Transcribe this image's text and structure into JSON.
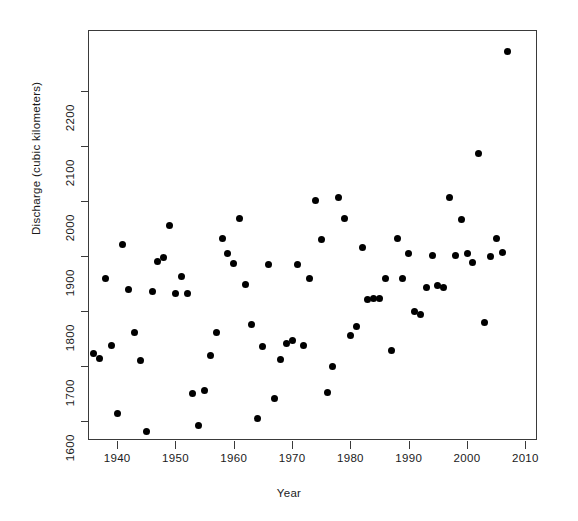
{
  "chart_data": {
    "type": "scatter",
    "title": "",
    "xlabel": "Year",
    "ylabel": "Discharge (cubic kilometers)",
    "xlim": [
      1935,
      2012
    ],
    "ylim": [
      1565,
      2310
    ],
    "xticks": [
      1940,
      1950,
      1960,
      1970,
      1980,
      1990,
      2000,
      2010
    ],
    "xtick_labels": [
      "1940",
      "1950",
      "1960",
      "1970",
      "1980",
      "1990",
      "2000",
      "2010"
    ],
    "yticks": [
      1600,
      1700,
      1800,
      1900,
      2000,
      2100,
      2200
    ],
    "ytick_labels": [
      "1600",
      "1700",
      "1800",
      "1900",
      "2000",
      "2100",
      "2200"
    ],
    "grid": false,
    "legend": null,
    "marker": "filled-circle",
    "marker_color": "#000000",
    "frame": true,
    "n_points": 72,
    "x": [
      1936,
      1937,
      1938,
      1939,
      1940,
      1941,
      1942,
      1943,
      1944,
      1945,
      1946,
      1947,
      1948,
      1949,
      1950,
      1951,
      1952,
      1953,
      1954,
      1955,
      1956,
      1957,
      1958,
      1959,
      1960,
      1961,
      1962,
      1963,
      1964,
      1965,
      1966,
      1967,
      1968,
      1969,
      1970,
      1971,
      1972,
      1973,
      1974,
      1975,
      1976,
      1977,
      1978,
      1979,
      1980,
      1981,
      1982,
      1983,
      1984,
      1985,
      1986,
      1987,
      1988,
      1989,
      1990,
      1991,
      1992,
      1993,
      1994,
      1995,
      1996,
      1997,
      1998,
      1999,
      2000,
      2001,
      2002,
      2003,
      2004,
      2005,
      2006,
      2007
    ],
    "y": [
      1722,
      1713,
      1858,
      1736,
      1614,
      1920,
      1838,
      1760,
      1710,
      1581,
      1835,
      1890,
      1897,
      1955,
      1832,
      1863,
      1832,
      1650,
      1591,
      1655,
      1719,
      1760,
      1932,
      1904,
      1885,
      1968,
      1848,
      1774,
      1604,
      1735,
      1884,
      1640,
      1712,
      1740,
      1745,
      1884,
      1736,
      1858,
      2000,
      1930,
      1651,
      1698,
      2005,
      1968,
      1755,
      1772,
      1914,
      1820,
      1822,
      1822,
      1858,
      1728,
      1932,
      1858,
      1903,
      1798,
      1793,
      1843,
      1900,
      1845,
      1843,
      2005,
      1901,
      1966,
      1903,
      1888,
      2085,
      1779,
      1899,
      1932,
      1905,
      2271
    ]
  },
  "points": [
    {
      "year": 1936,
      "discharge": 1722
    },
    {
      "year": 1937,
      "discharge": 1713
    },
    {
      "year": 1938,
      "discharge": 1858
    },
    {
      "year": 1939,
      "discharge": 1736
    },
    {
      "year": 1940,
      "discharge": 1614
    },
    {
      "year": 1941,
      "discharge": 1920
    },
    {
      "year": 1942,
      "discharge": 1838
    },
    {
      "year": 1943,
      "discharge": 1760
    },
    {
      "year": 1944,
      "discharge": 1710
    },
    {
      "year": 1945,
      "discharge": 1581
    },
    {
      "year": 1946,
      "discharge": 1835
    },
    {
      "year": 1947,
      "discharge": 1890
    },
    {
      "year": 1948,
      "discharge": 1897
    },
    {
      "year": 1949,
      "discharge": 1955
    },
    {
      "year": 1950,
      "discharge": 1832
    },
    {
      "year": 1951,
      "discharge": 1863
    },
    {
      "year": 1952,
      "discharge": 1832
    },
    {
      "year": 1953,
      "discharge": 1650
    },
    {
      "year": 1954,
      "discharge": 1591
    },
    {
      "year": 1955,
      "discharge": 1655
    },
    {
      "year": 1956,
      "discharge": 1719
    },
    {
      "year": 1957,
      "discharge": 1760
    },
    {
      "year": 1958,
      "discharge": 1932
    },
    {
      "year": 1959,
      "discharge": 1904
    },
    {
      "year": 1960,
      "discharge": 1885
    },
    {
      "year": 1961,
      "discharge": 1968
    },
    {
      "year": 1962,
      "discharge": 1848
    },
    {
      "year": 1963,
      "discharge": 1774
    },
    {
      "year": 1964,
      "discharge": 1604
    },
    {
      "year": 1965,
      "discharge": 1735
    },
    {
      "year": 1966,
      "discharge": 1884
    },
    {
      "year": 1967,
      "discharge": 1640
    },
    {
      "year": 1968,
      "discharge": 1712
    },
    {
      "year": 1969,
      "discharge": 1740
    },
    {
      "year": 1970,
      "discharge": 1745
    },
    {
      "year": 1971,
      "discharge": 1884
    },
    {
      "year": 1972,
      "discharge": 1736
    },
    {
      "year": 1973,
      "discharge": 1858
    },
    {
      "year": 1974,
      "discharge": 2000
    },
    {
      "year": 1975,
      "discharge": 1930
    },
    {
      "year": 1976,
      "discharge": 1651
    },
    {
      "year": 1977,
      "discharge": 1698
    },
    {
      "year": 1978,
      "discharge": 2005
    },
    {
      "year": 1979,
      "discharge": 1968
    },
    {
      "year": 1980,
      "discharge": 1755
    },
    {
      "year": 1981,
      "discharge": 1772
    },
    {
      "year": 1982,
      "discharge": 1914
    },
    {
      "year": 1983,
      "discharge": 1820
    },
    {
      "year": 1984,
      "discharge": 1822
    },
    {
      "year": 1985,
      "discharge": 1822
    },
    {
      "year": 1986,
      "discharge": 1858
    },
    {
      "year": 1987,
      "discharge": 1728
    },
    {
      "year": 1988,
      "discharge": 1932
    },
    {
      "year": 1989,
      "discharge": 1858
    },
    {
      "year": 1990,
      "discharge": 1903
    },
    {
      "year": 1991,
      "discharge": 1798
    },
    {
      "year": 1992,
      "discharge": 1793
    },
    {
      "year": 1993,
      "discharge": 1843
    },
    {
      "year": 1994,
      "discharge": 1900
    },
    {
      "year": 1995,
      "discharge": 1845
    },
    {
      "year": 1996,
      "discharge": 1843
    },
    {
      "year": 1997,
      "discharge": 2005
    },
    {
      "year": 1998,
      "discharge": 1901
    },
    {
      "year": 1999,
      "discharge": 1966
    },
    {
      "year": 2000,
      "discharge": 1903
    },
    {
      "year": 2001,
      "discharge": 1888
    },
    {
      "year": 2002,
      "discharge": 2085
    },
    {
      "year": 2003,
      "discharge": 1779
    },
    {
      "year": 2004,
      "discharge": 1899
    },
    {
      "year": 2005,
      "discharge": 1932
    },
    {
      "year": 2006,
      "discharge": 1905
    },
    {
      "year": 2007,
      "discharge": 2271
    }
  ]
}
